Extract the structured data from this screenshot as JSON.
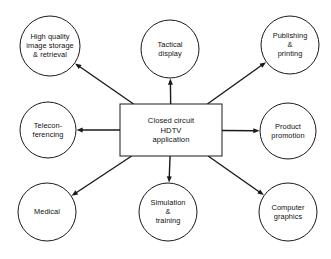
{
  "diagram": {
    "type": "hub-and-spoke",
    "colors": {
      "stroke": "#1a1a1a",
      "fill": "#ffffff",
      "text": "#111111",
      "background": "#ffffff"
    },
    "center": {
      "id": "center-node",
      "shape": "rectangle",
      "label": "Closed circuit\nHDTV\napplication",
      "lines": [
        "Closed circuit",
        "HDTV",
        "application"
      ],
      "x": 171,
      "y": 130,
      "width": 102,
      "height": 52
    },
    "nodes": [
      {
        "id": "high-quality-image-storage",
        "shape": "circle",
        "label": "High quality\nimage storage\n& retrieval",
        "lines": [
          "High quality",
          "image storage",
          "& retrieval"
        ],
        "cx": 50,
        "cy": 46,
        "r": 30,
        "direction": "upper-left"
      },
      {
        "id": "tactical-display",
        "shape": "circle",
        "label": "Tactical\ndisplay",
        "lines": [
          "Tactical",
          "display"
        ],
        "cx": 170,
        "cy": 49,
        "r": 29,
        "direction": "up"
      },
      {
        "id": "publishing-printing",
        "shape": "circle",
        "label": "Publishing\n&\nprinting",
        "lines": [
          "Publishing",
          "&",
          "printing"
        ],
        "cx": 290,
        "cy": 45,
        "r": 29,
        "direction": "upper-right"
      },
      {
        "id": "teleconferencing",
        "shape": "circle",
        "label": "Telecon-\nferencing",
        "lines": [
          "Telecon-",
          "ferencing"
        ],
        "cx": 48,
        "cy": 130,
        "r": 28,
        "direction": "left"
      },
      {
        "id": "product-promotion",
        "shape": "circle",
        "label": "Product\npromotion",
        "lines": [
          "Product",
          "promotion"
        ],
        "cx": 288,
        "cy": 131,
        "r": 28,
        "direction": "right"
      },
      {
        "id": "medical",
        "shape": "circle",
        "label": "Medical",
        "lines": [
          "Medical"
        ],
        "cx": 47,
        "cy": 212,
        "r": 29,
        "direction": "lower-left"
      },
      {
        "id": "simulation-training",
        "shape": "circle",
        "label": "Simulation\n&\ntraining",
        "lines": [
          "Simulation",
          "&",
          "training"
        ],
        "cx": 168,
        "cy": 212,
        "r": 29,
        "direction": "down"
      },
      {
        "id": "computer-graphics",
        "shape": "circle",
        "label": "Computer\ngraphics",
        "lines": [
          "Computer",
          "graphics"
        ],
        "cx": 288,
        "cy": 212,
        "r": 29,
        "direction": "lower-right"
      }
    ],
    "edges": [
      {
        "id": "edge-to-high-quality-image-storage",
        "from": "center-node",
        "to": "high-quality-image-storage",
        "arrow": "to"
      },
      {
        "id": "edge-to-tactical-display",
        "from": "center-node",
        "to": "tactical-display",
        "arrow": "to"
      },
      {
        "id": "edge-to-publishing-printing",
        "from": "center-node",
        "to": "publishing-printing",
        "arrow": "to"
      },
      {
        "id": "edge-to-teleconferencing",
        "from": "center-node",
        "to": "teleconferencing",
        "arrow": "to"
      },
      {
        "id": "edge-to-product-promotion",
        "from": "center-node",
        "to": "product-promotion",
        "arrow": "to"
      },
      {
        "id": "edge-to-medical",
        "from": "center-node",
        "to": "medical",
        "arrow": "to"
      },
      {
        "id": "edge-to-simulation-training",
        "from": "center-node",
        "to": "simulation-training",
        "arrow": "to"
      },
      {
        "id": "edge-to-computer-graphics",
        "from": "center-node",
        "to": "computer-graphics",
        "arrow": "to"
      }
    ]
  }
}
